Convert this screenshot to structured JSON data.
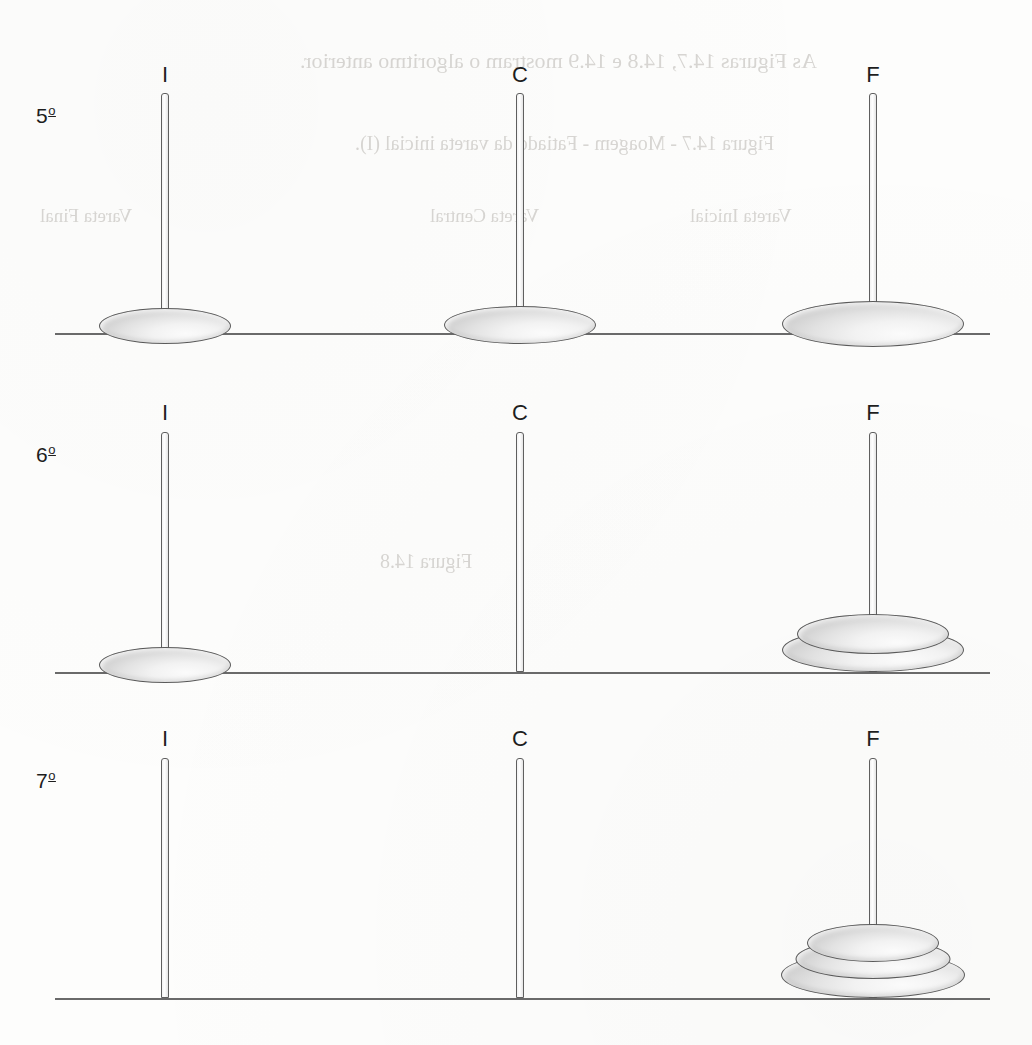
{
  "figure": {
    "peg_labels": [
      "I",
      "C",
      "F"
    ],
    "peg_positions_px": [
      165,
      520,
      873
    ],
    "baseline_color": "#6a6a6a",
    "disc_outline_color": "#5a5a5a",
    "disc_fill_light": "#fbfbfb",
    "disc_fill_dark": "#b2b2b2"
  },
  "rows": [
    {
      "step_number": "5",
      "ordinal_suffix": "o",
      "step_label": "5",
      "baseline_y": 333,
      "peg_top_y": 93,
      "pegs": [
        {
          "name": "I",
          "label": "I",
          "label_y": 62,
          "discs": [
            {
              "size": 1,
              "width": 132,
              "height": 36
            }
          ]
        },
        {
          "name": "C",
          "label": "C",
          "label_y": 62,
          "discs": [
            {
              "size": 2,
              "width": 152,
              "height": 38
            }
          ]
        },
        {
          "name": "F",
          "label": "F",
          "label_y": 62,
          "discs": [
            {
              "size": 3,
              "width": 182,
              "height": 46
            }
          ]
        }
      ]
    },
    {
      "step_number": "6",
      "ordinal_suffix": "o",
      "step_label": "6",
      "baseline_y": 672,
      "peg_top_y": 432,
      "pegs": [
        {
          "name": "I",
          "label": "I",
          "label_y": 400,
          "discs": [
            {
              "size": 1,
              "width": 132,
              "height": 36
            }
          ]
        },
        {
          "name": "C",
          "label": "C",
          "label_y": 400,
          "discs": []
        },
        {
          "name": "F",
          "label": "F",
          "label_y": 400,
          "discs": [
            {
              "size": 2,
              "width": 152,
              "height": 40
            },
            {
              "size": 3,
              "width": 182,
              "height": 44
            }
          ]
        }
      ]
    },
    {
      "step_number": "7",
      "ordinal_suffix": "o",
      "step_label": "7",
      "baseline_y": 998,
      "peg_top_y": 758,
      "pegs": [
        {
          "name": "I",
          "label": "I",
          "label_y": 726,
          "discs": []
        },
        {
          "name": "C",
          "label": "C",
          "label_y": 726,
          "discs": []
        },
        {
          "name": "F",
          "label": "F",
          "label_y": 726,
          "discs": [
            {
              "size": 1,
              "width": 132,
              "height": 38
            },
            {
              "size": 2,
              "width": 155,
              "height": 40
            },
            {
              "size": 3,
              "width": 184,
              "height": 46
            }
          ]
        }
      ]
    }
  ],
  "bleed_through_text": [
    {
      "text": "As Figuras 14.7, 14.8 e 14.9 mostram o algoritmo anterior.",
      "x": 300,
      "y": 48,
      "size": 22
    },
    {
      "text": "Figura 14.7 - Moagem - Fatiado da vareta inicial (I).",
      "x": 355,
      "y": 132,
      "size": 20
    },
    {
      "text": "Vareta Inicial",
      "x": 690,
      "y": 205,
      "size": 19
    },
    {
      "text": "Vareta Central",
      "x": 430,
      "y": 205,
      "size": 19
    },
    {
      "text": "Vareta Final",
      "x": 40,
      "y": 205,
      "size": 19
    },
    {
      "text": "Figura 14.8",
      "x": 380,
      "y": 550,
      "size": 20
    }
  ]
}
